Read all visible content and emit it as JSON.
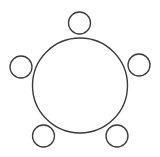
{
  "diagram": {
    "title": "",
    "stroke_color": "#3a3a3a",
    "background": "#ffffff",
    "table": {
      "shape": "circle",
      "cx": 80,
      "cy": 85.5,
      "r": 47.5
    },
    "seats": [
      {
        "id": "top",
        "cx": 79.5,
        "cy": 23,
        "r": 11
      },
      {
        "id": "left",
        "cx": 21,
        "cy": 67,
        "r": 11
      },
      {
        "id": "right",
        "cx": 139,
        "cy": 65,
        "r": 11
      },
      {
        "id": "bottom-left",
        "cx": 43.5,
        "cy": 136,
        "r": 11
      },
      {
        "id": "bottom-right",
        "cx": 117,
        "cy": 136,
        "r": 11
      }
    ]
  }
}
